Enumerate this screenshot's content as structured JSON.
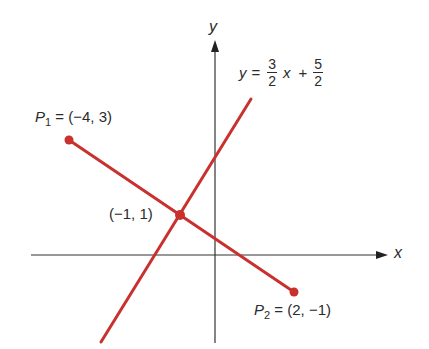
{
  "diagram": {
    "axes": {
      "x_label": "x",
      "y_label": "y"
    },
    "line": {
      "equation_lhs": "y",
      "equals": "=",
      "slope_num": "3",
      "slope_den": "2",
      "var": "x",
      "plus": "+",
      "intercept_num": "5",
      "intercept_den": "2"
    },
    "points": {
      "p1": {
        "name": "P",
        "sub": "1",
        "value": "= (−4, 3)"
      },
      "p2": {
        "name": "P",
        "sub": "2",
        "value": "= (2, −1)"
      },
      "intersection": {
        "value": "(−1, 1)"
      }
    },
    "colors": {
      "line": "#c8312e",
      "axis": "#333333",
      "text": "#2b2b2b"
    }
  }
}
